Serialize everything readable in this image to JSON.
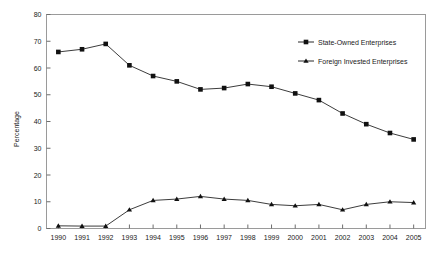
{
  "chart_data": {
    "type": "line",
    "title": "",
    "xlabel": "",
    "ylabel": "Percentage",
    "x": [
      1990,
      1991,
      1992,
      1993,
      1994,
      1995,
      1996,
      1997,
      1998,
      1999,
      2000,
      2001,
      2002,
      2003,
      2004,
      2005
    ],
    "xtick_labels": [
      "1990",
      "1991",
      "1992",
      "1993",
      "1994",
      "1995",
      "1996",
      "1997",
      "1998",
      "1999",
      "2000",
      "2001",
      "2002",
      "2003",
      "2004",
      "2005"
    ],
    "ylim": [
      0,
      80
    ],
    "ytick_labels": [
      "0",
      "10",
      "20",
      "30",
      "40",
      "50",
      "60",
      "70",
      "80"
    ],
    "yticks": [
      0,
      10,
      20,
      30,
      40,
      50,
      60,
      70,
      80
    ],
    "grid": false,
    "legend_position": "top-right",
    "series": [
      {
        "name": "State-Owned Enterprises",
        "marker": "square",
        "color": "#111111",
        "values": [
          66,
          67,
          69,
          61,
          57,
          55,
          52,
          52.5,
          54,
          53,
          50.5,
          48,
          43,
          39,
          35.7,
          33.3
        ]
      },
      {
        "name": "Foreign Invested Enterprises",
        "marker": "triangle",
        "color": "#111111",
        "values": [
          1,
          0.9,
          0.9,
          7,
          10.5,
          11,
          12,
          11,
          10.5,
          9,
          8.5,
          9,
          7,
          9,
          10,
          9.7
        ]
      }
    ]
  },
  "axes": {
    "y_title": "Percentage"
  }
}
